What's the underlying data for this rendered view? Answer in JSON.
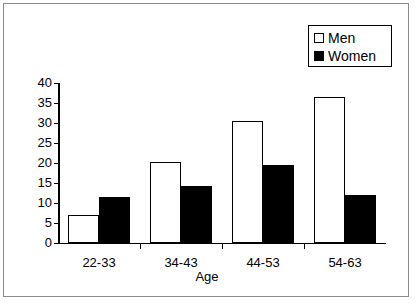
{
  "chart_data": {
    "type": "bar",
    "title": "",
    "xlabel": "Age",
    "ylabel": "",
    "categories": [
      "22-33",
      "34-43",
      "44-53",
      "54-63"
    ],
    "series": [
      {
        "name": "Men",
        "values": [
          7.1,
          20.3,
          30.6,
          36.5
        ],
        "color": "#ffffff",
        "swatch": "open"
      },
      {
        "name": "Women",
        "values": [
          11.6,
          14.2,
          19.5,
          12.0
        ],
        "color": "#000000",
        "swatch": "filled"
      }
    ],
    "ylim": [
      0,
      40
    ],
    "yticks": [
      0,
      5,
      10,
      15,
      20,
      25,
      30,
      35,
      40
    ],
    "ytick_labels": [
      "0",
      "5",
      "10",
      "15",
      "20",
      "25",
      "30",
      "35",
      "40"
    ],
    "grid": false,
    "legend_position": "top-right"
  },
  "legend": {
    "entries": [
      {
        "label": "Men"
      },
      {
        "label": "Women"
      }
    ]
  },
  "axis": {
    "x_title": "Age"
  }
}
